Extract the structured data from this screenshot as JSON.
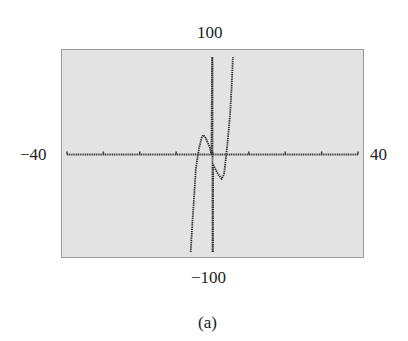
{
  "chart_data": {
    "type": "line",
    "title": "",
    "caption": "(a)",
    "xlabel": "",
    "ylabel": "",
    "xlim": [
      -40,
      40
    ],
    "ylim": [
      -100,
      100
    ],
    "window_labels": {
      "xmin": "−40",
      "xmax": "40",
      "ymin": "−100",
      "ymax": "100"
    },
    "x_ticks": [
      -40,
      -30,
      -20,
      -10,
      0,
      10,
      20,
      30,
      40
    ],
    "grid": false,
    "legend": null,
    "style": {
      "background": "#e3e3e3",
      "frame": "#9a9a9a",
      "curve": "#333333",
      "axis": "#444444",
      "dotted": true
    },
    "series": [
      {
        "name": "curve",
        "points": [
          [
            -6.0,
            -100
          ],
          [
            -5.6,
            -75
          ],
          [
            -5.0,
            -40
          ],
          [
            -4.6,
            -15
          ],
          [
            -4.0,
            0
          ],
          [
            -3.6,
            8
          ],
          [
            -3.0,
            17
          ],
          [
            -2.6,
            20
          ],
          [
            -2.0,
            18
          ],
          [
            -1.4,
            13
          ],
          [
            -0.8,
            8
          ],
          [
            -0.3,
            0
          ],
          [
            -0.1,
            100
          ]
        ]
      },
      {
        "name": "curve-branch-2",
        "points": [
          [
            0.1,
            -100
          ],
          [
            0.2,
            -10
          ],
          [
            0.8,
            -15
          ],
          [
            1.5,
            -20
          ],
          [
            2.5,
            -25
          ],
          [
            3.2,
            -20
          ],
          [
            3.8,
            0
          ],
          [
            4.2,
            15
          ],
          [
            4.8,
            40
          ],
          [
            5.2,
            65
          ],
          [
            5.6,
            100
          ]
        ]
      },
      {
        "name": "vertical-segment",
        "points": [
          [
            0.0,
            -100
          ],
          [
            0.0,
            100
          ]
        ]
      }
    ]
  }
}
